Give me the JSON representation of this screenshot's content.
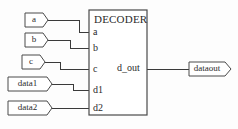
{
  "diagram": {
    "type": "schematic-block-diagram",
    "block": {
      "name": "DECODER",
      "input_pins": [
        "a",
        "b",
        "c",
        "d1",
        "d2"
      ],
      "output_pins": [
        "d_out"
      ]
    },
    "input_tags": [
      {
        "label": "a",
        "connects_to": "a"
      },
      {
        "label": "b",
        "connects_to": "b"
      },
      {
        "label": "c",
        "connects_to": "c"
      },
      {
        "label": "data1",
        "connects_to": "d1"
      },
      {
        "label": "data2",
        "connects_to": "d2"
      }
    ],
    "output_tags": [
      {
        "label": "dataout",
        "connects_from": "d_out"
      }
    ],
    "colors": {
      "background": "#fdfdfd",
      "line": "#4a4a4a",
      "wire": "#3a3a3a",
      "text": "#2b2b2b",
      "fill": "#ffffff"
    }
  }
}
